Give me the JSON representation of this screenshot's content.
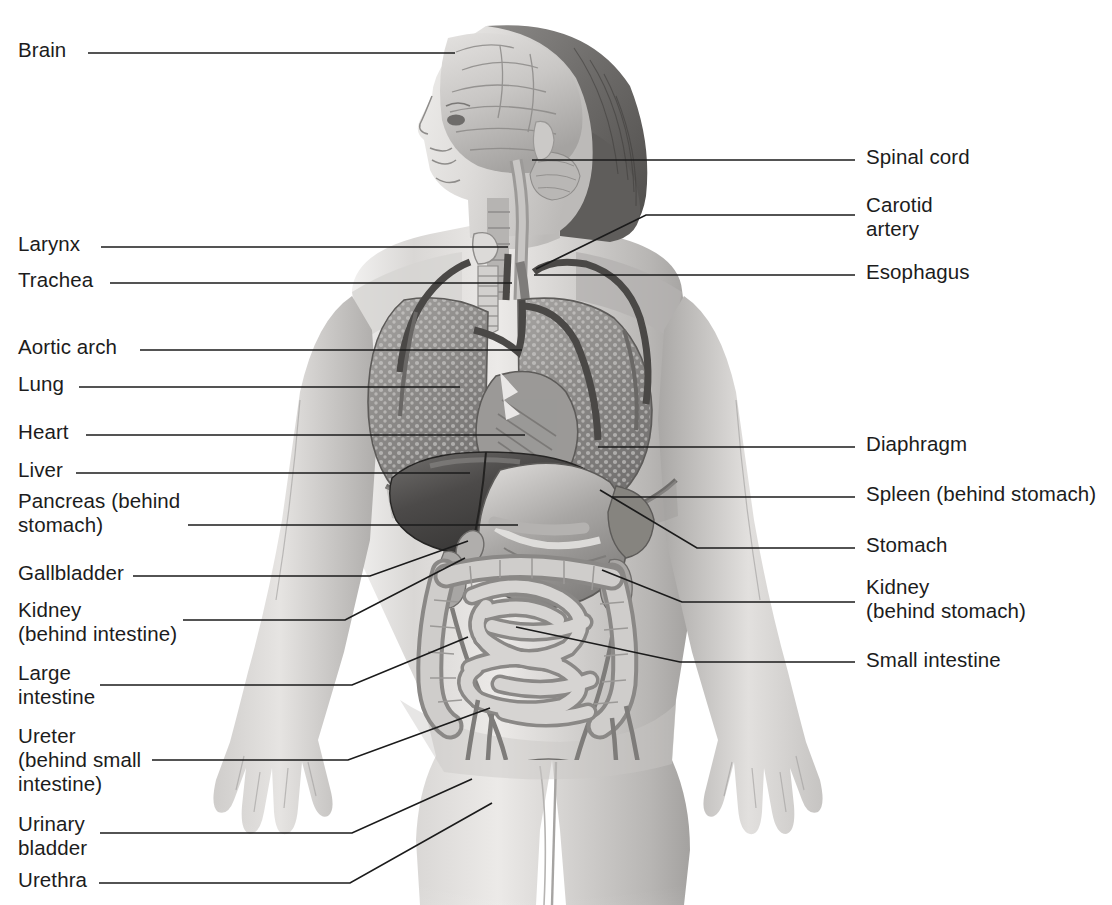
{
  "figure": {
    "background_color": "#ffffff",
    "line_color": "#1b1b1b",
    "text_color": "#1c1c1c"
  },
  "labels_left": [
    {
      "id": "brain",
      "text": "Brain",
      "x": 18,
      "y": 38,
      "line": "88,53 455,53"
    },
    {
      "id": "larynx",
      "text": "Larynx",
      "x": 18,
      "y": 232,
      "line": "101,247 508,247"
    },
    {
      "id": "trachea",
      "text": "Trachea",
      "x": 18,
      "y": 268,
      "line": "110,283 512,283"
    },
    {
      "id": "aortic-arch",
      "text": "Aortic arch",
      "x": 18,
      "y": 335,
      "line": "140,350 522,350"
    },
    {
      "id": "lung",
      "text": "Lung",
      "x": 18,
      "y": 372,
      "line": "79,387 460,387"
    },
    {
      "id": "heart",
      "text": "Heart",
      "x": 18,
      "y": 420,
      "line": "86,435 525,435"
    },
    {
      "id": "liver",
      "text": "Liver",
      "x": 18,
      "y": 458,
      "line": "76,473 470,473"
    },
    {
      "id": "pancreas",
      "text": "Pancreas (behind\nstomach)",
      "x": 18,
      "y": 489,
      "line": "188,525 518,525"
    },
    {
      "id": "gallbladder",
      "text": "Gallbladder",
      "x": 18,
      "y": 561,
      "line": "133,576 370,576 468,541"
    },
    {
      "id": "kidney-left",
      "text": "Kidney\n(behind intestine)",
      "x": 18,
      "y": 598,
      "line": "183,620 345,620 465,558"
    },
    {
      "id": "large-intestine",
      "text": "Large\nintestine",
      "x": 18,
      "y": 661,
      "line": "100,685 352,685 468,637"
    },
    {
      "id": "ureter",
      "text": "Ureter\n(behind small\nintestine)",
      "x": 18,
      "y": 724,
      "line": "152,760 348,760 490,708"
    },
    {
      "id": "urinary-bladder",
      "text": "Urinary\nbladder",
      "x": 18,
      "y": 812,
      "line": "100,833 352,833 472,779"
    },
    {
      "id": "urethra",
      "text": "Urethra",
      "x": 18,
      "y": 868,
      "line": "99,883 350,883 492,803"
    }
  ],
  "labels_right": [
    {
      "id": "spinal-cord",
      "text": "Spinal cord",
      "x": 866,
      "y": 145,
      "line": "532,160 855,160"
    },
    {
      "id": "carotid",
      "text": "Carotid\nartery",
      "x": 866,
      "y": 193,
      "line": "536,269 646,215 855,215"
    },
    {
      "id": "esophagus",
      "text": "Esophagus",
      "x": 866,
      "y": 260,
      "line": "534,275 855,275"
    },
    {
      "id": "diaphragm",
      "text": "Diaphragm",
      "x": 866,
      "y": 432,
      "line": "598,447 855,447"
    },
    {
      "id": "spleen",
      "text": "Spleen (behind stomach)",
      "x": 866,
      "y": 482,
      "line": "612,497 855,497"
    },
    {
      "id": "stomach",
      "text": "Stomach",
      "x": 866,
      "y": 533,
      "line": "600,490 697,548 855,548"
    },
    {
      "id": "kidney-right",
      "text": "Kidney\n(behind stomach)",
      "x": 866,
      "y": 575,
      "line": "602,570 682,602 855,602"
    },
    {
      "id": "small-intestine",
      "text": "Small intestine",
      "x": 866,
      "y": 648,
      "line": "516,627 680,662 855,662"
    }
  ]
}
